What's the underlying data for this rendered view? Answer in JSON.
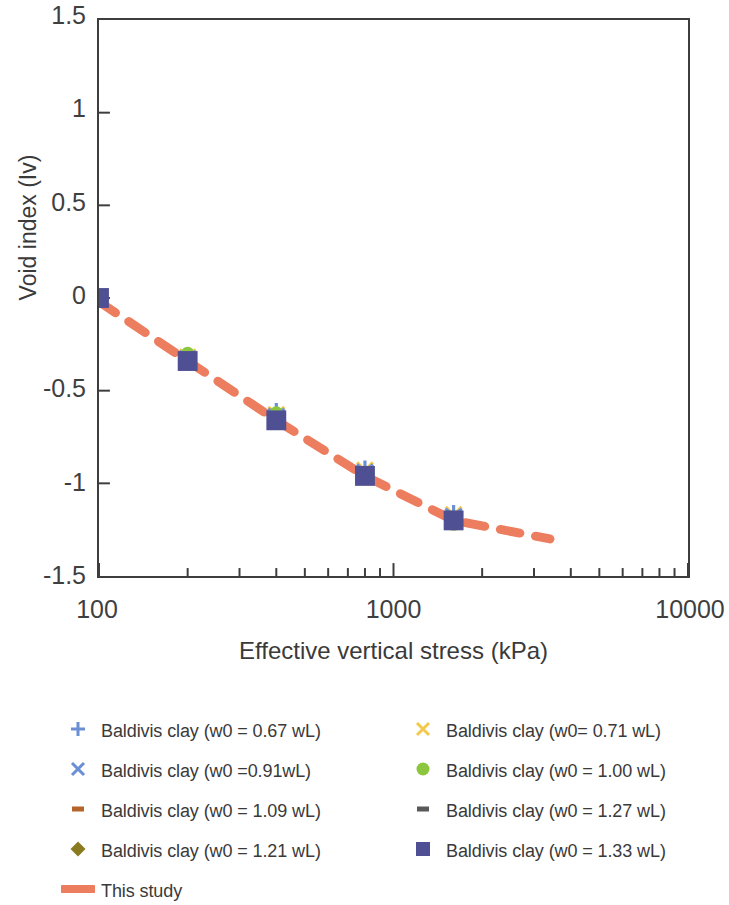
{
  "chart_data": {
    "type": "scatter",
    "title": "",
    "xlabel": "Effective vertical stress (kPa)",
    "ylabel": "Void index (Iv)",
    "xscale": "log",
    "xlim": [
      100,
      10000
    ],
    "ylim": [
      -1.5,
      1.5
    ],
    "x_ticks": [
      100,
      1000,
      10000
    ],
    "x_tick_labels": [
      "100",
      "1000",
      "10000"
    ],
    "y_ticks": [
      1.5,
      1,
      0.5,
      0,
      -0.5,
      -1,
      -1.5
    ],
    "y_tick_labels": [
      "1.5",
      "1",
      "0.5",
      "0",
      "-0.5",
      "-1",
      "-1.5"
    ],
    "grid": false,
    "legend_position": "below",
    "series": [
      {
        "name": "Baldivis clay (w0 = 0.67 wL)",
        "marker": "plus",
        "color": "#6B8FD4",
        "x": [
          100,
          200,
          400,
          800,
          1600
        ],
        "y": [
          0.0,
          -0.31,
          -0.61,
          -0.92,
          -1.16
        ]
      },
      {
        "name": "Baldivis clay (w0= 0.71 wL)",
        "marker": "cross",
        "color": "#F2C94C",
        "x": [
          100,
          200,
          400,
          800,
          1600
        ],
        "y": [
          0.0,
          -0.32,
          -0.63,
          -0.93,
          -1.17
        ]
      },
      {
        "name": "Baldivis clay (w0 =0.91wL)",
        "marker": "cross",
        "color": "#6B8FD4",
        "x": [
          100,
          200,
          400,
          800,
          1600
        ],
        "y": [
          0.0,
          -0.33,
          -0.64,
          -0.94,
          -1.18
        ]
      },
      {
        "name": "Baldivis clay (w0 = 1.00 wL)",
        "marker": "circle",
        "color": "#8CC63F",
        "x": [
          100,
          200,
          400,
          800,
          1600
        ],
        "y": [
          0.0,
          -0.3,
          -0.62,
          -0.95,
          -1.22
        ]
      },
      {
        "name": "Baldivis clay (w0 = 1.09 wL)",
        "marker": "dash-small",
        "color": "#B5652A",
        "x": [
          100,
          200,
          400,
          800,
          1600
        ],
        "y": [
          0.0,
          -0.34,
          -0.66,
          -0.96,
          -1.2
        ]
      },
      {
        "name": "Baldivis clay (w0 = 1.27 wL)",
        "marker": "dash-small",
        "color": "#595959",
        "x": [
          100,
          200,
          400,
          800,
          1600
        ],
        "y": [
          0.0,
          -0.35,
          -0.67,
          -0.97,
          -1.21
        ]
      },
      {
        "name": "Baldivis clay (w0 = 1.21 wL)",
        "marker": "diamond",
        "color": "#8A7B20",
        "x": [
          100,
          200,
          400,
          800,
          1600
        ],
        "y": [
          0.0,
          -0.33,
          -0.65,
          -0.95,
          -1.19
        ]
      },
      {
        "name": "Baldivis clay (w0 = 1.33 wL)",
        "marker": "square",
        "color": "#4F4F93",
        "x": [
          100,
          200,
          400,
          800,
          1600
        ],
        "y": [
          0.0,
          -0.34,
          -0.66,
          -0.96,
          -1.2
        ]
      },
      {
        "name": "This study",
        "marker": "dashed-line",
        "color": "#ED7D5F",
        "line": {
          "style": "dashed",
          "width": 9,
          "x_start": 100,
          "x_end": 3400,
          "points": [
            {
              "x": 100,
              "y": -0.02
            },
            {
              "x": 200,
              "y": -0.34
            },
            {
              "x": 400,
              "y": -0.66
            },
            {
              "x": 800,
              "y": -0.96
            },
            {
              "x": 1600,
              "y": -1.2
            },
            {
              "x": 3400,
              "y": -1.3
            }
          ]
        }
      }
    ],
    "annotations": []
  },
  "axes": {
    "y_title": "Void index (Iv)",
    "x_title": "Effective vertical stress (kPa)",
    "y_labels": [
      "1.5",
      "1",
      "0.5",
      "0",
      "-0.5",
      "-1",
      "-1.5"
    ],
    "x_labels": [
      "100",
      "1000",
      "10000"
    ]
  },
  "legend": {
    "left_column": [
      {
        "label": "Baldivis clay (w0 = 0.67 wL)",
        "marker": "plus",
        "color": "#6B8FD4"
      },
      {
        "label": "Baldivis clay (w0 =0.91wL)",
        "marker": "cross",
        "color": "#6B8FD4"
      },
      {
        "label": "Baldivis clay (w0 = 1.09 wL)",
        "marker": "dash-small",
        "color": "#B5652A"
      },
      {
        "label": "Baldivis clay (w0 = 1.21 wL)",
        "marker": "diamond",
        "color": "#8A7B20"
      },
      {
        "label": "This study",
        "marker": "dashed-line",
        "color": "#ED7D5F"
      }
    ],
    "right_column": [
      {
        "label": "Baldivis clay (w0= 0.71 wL)",
        "marker": "cross",
        "color": "#F2C94C"
      },
      {
        "label": "Baldivis clay (w0 = 1.00 wL)",
        "marker": "circle",
        "color": "#8CC63F"
      },
      {
        "label": "Baldivis clay (w0 = 1.27 wL)",
        "marker": "dash-small",
        "color": "#595959"
      },
      {
        "label": "Baldivis clay (w0 = 1.33 wL)",
        "marker": "square",
        "color": "#4F4F93"
      }
    ]
  },
  "colors": {
    "axis": "#3d3d3d",
    "text": "#3a3a3a",
    "this_study_line": "#ED7D5F",
    "square_marker": "#4F4F93",
    "green_marker": "#8CC63F",
    "yellow_marker": "#F2C94C",
    "blue_marker": "#6B8FD4",
    "olive_marker": "#8A7B20",
    "rust_marker": "#B5652A",
    "gray_marker": "#595959"
  }
}
